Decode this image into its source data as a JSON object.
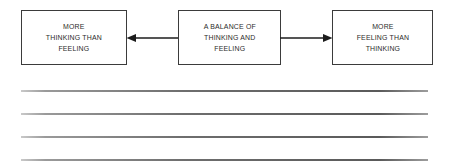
{
  "diagram": {
    "type": "continuum-flow",
    "orientation": "horizontal",
    "nodes": [
      {
        "id": "thinking",
        "label": "MORE\nTHINKING THAN\nFEELING",
        "lines": [
          "MORE",
          "THINKING THAN",
          "FEELING"
        ]
      },
      {
        "id": "balance",
        "label": "A BALANCE OF\nTHINKING AND\nFEELING",
        "lines": [
          "A BALANCE OF",
          "THINKING AND",
          "FEELING"
        ]
      },
      {
        "id": "feeling",
        "label": "MORE\nFEELING THAN\nTHINKING",
        "lines": [
          "MORE",
          "FEELING THAN",
          "THINKING"
        ]
      }
    ],
    "connectors": [
      {
        "id": "left",
        "from": "balance",
        "to": "thinking",
        "direction": "left",
        "arrowhead": "end"
      },
      {
        "id": "right",
        "from": "balance",
        "to": "feeling",
        "direction": "right",
        "arrowhead": "end"
      }
    ],
    "colors": {
      "box_border": "#3b3b3b",
      "box_fill": "#ffffff",
      "text": "#2b2b2b",
      "connector": "#1c1c1c",
      "rule": "#6e6e6e",
      "page_background": "#ffffff"
    }
  },
  "worksheet": {
    "rules": [
      {
        "id": "rule-1"
      },
      {
        "id": "rule-2"
      },
      {
        "id": "rule-3"
      },
      {
        "id": "rule-4"
      }
    ],
    "rule_count": 4
  }
}
